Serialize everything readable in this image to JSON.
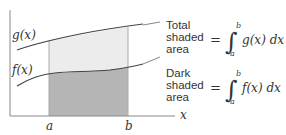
{
  "diagram": {
    "curves": [
      {
        "name": "g",
        "label": "g(x)"
      },
      {
        "name": "f",
        "label": "f(x)"
      }
    ],
    "axis": {
      "x_label": "x",
      "ticks": [
        "a",
        "b"
      ]
    },
    "annotations": [
      {
        "label_lines": [
          "Total",
          "shaded",
          "area"
        ],
        "equals": "=",
        "lower": "a",
        "upper": "b",
        "integrand": "g(x) dx"
      },
      {
        "label_lines": [
          "Dark",
          "shaded",
          "area"
        ],
        "equals": "=",
        "lower": "a",
        "upper": "b",
        "integrand": "f(x) dx"
      }
    ],
    "colors": {
      "light_shade": "#ececec",
      "dark_shade": "#b5b5b5",
      "line": "#444444"
    }
  }
}
